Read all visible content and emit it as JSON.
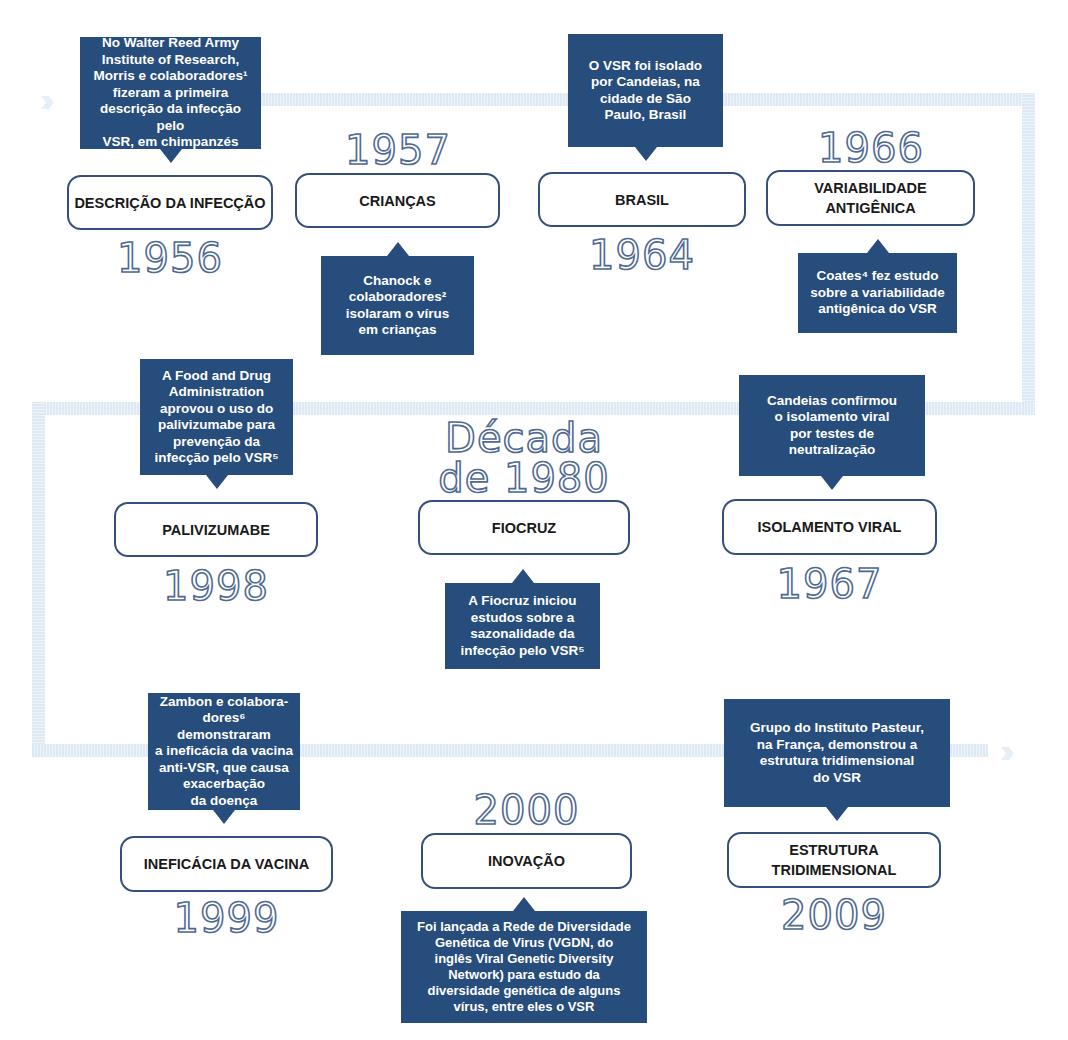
{
  "colors": {
    "callout_bg": "#274d7c",
    "box_border": "#33507a",
    "year_outline": "#4f6a92",
    "track": "#e6eff8"
  },
  "arrows": {
    "start_icon": "double-chevron-right",
    "end_icon": "double-chevron-right",
    "start_glyph": "››",
    "end_glyph": "››"
  },
  "events": [
    {
      "title": "DESCRIÇÃO DA INFECÇÃO",
      "year": "1956",
      "text": "No Walter Reed Army\nInstitute of Research,\nMorris e colaboradores¹\nfizeram a  primeira\ndescrição da infecção pelo\nVSR, em chimpanzés"
    },
    {
      "title": "CRIANÇAS",
      "year": "1957",
      "text": "Chanock e\ncolaboradores²\nisolaram o vírus\nem crianças"
    },
    {
      "title": "BRASIL",
      "year": "1964",
      "text": "O VSR foi isolado\npor  Candeias, na\ncidade de São\nPaulo, Brasil"
    },
    {
      "title": "VARIABILIDADE\nANTIGÊNICA",
      "year": "1966",
      "text": "Coates⁴ fez estudo\nsobre a variabilidade\nantigênica do VSR"
    },
    {
      "title": "ISOLAMENTO VIRAL",
      "year": "1967",
      "text": "Candeias confirmou\no isolamento viral\npor testes de\nneutralização"
    },
    {
      "title": "FIOCRUZ",
      "year": "Década\nde 1980",
      "text": "A Fiocruz iniciou\nestudos sobre a\nsazonalidade da\ninfecção pelo VSR⁵"
    },
    {
      "title": "PALIVIZUMABE",
      "year": "1998",
      "text": "A Food and Drug\nAdministration\naprovou o uso do\npalivizumabe para\nprevenção da\ninfecção pelo VSR⁵"
    },
    {
      "title": "INEFICÁCIA DA VACINA",
      "year": "1999",
      "text": "Zambon e colabora-\ndores⁶ demonstraram\na ineficácia da vacina\nanti-VSR, que causa\nexacerbação\nda doença"
    },
    {
      "title": "INOVAÇÃO",
      "year": "2000",
      "text": "Foi lançada a Rede de Diversidade\nGenética de Virus (VGDN, do\ninglês Viral Genetic Diversity\nNetwork) para estudo da\ndiversidade genética de alguns\nvírus, entre eles o VSR"
    },
    {
      "title": "ESTRUTURA\nTRIDIMENSIONAL",
      "year": "2009",
      "text": "Grupo do Instituto Pasteur,\nna França, demonstrou a\nestrutura  tridimensional\ndo VSR"
    }
  ]
}
